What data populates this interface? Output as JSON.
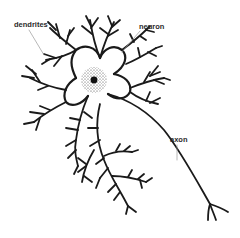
{
  "diagram": {
    "subject": "neuron",
    "labels": {
      "dendrites": "dendrites",
      "neuron": "neuron",
      "axon": "axon"
    },
    "colors": {
      "ink": "#1a1a1a",
      "leader": "#9a9a9a",
      "label": "#2a2a2a",
      "background": "#ffffff"
    }
  }
}
